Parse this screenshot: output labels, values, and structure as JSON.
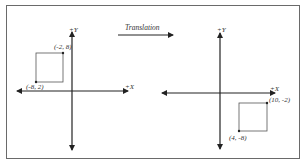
{
  "title": "Translation",
  "left_plane": {
    "x_axis_label": "+X",
    "y_axis_label": "+Y",
    "square": {
      "top_right_label": "(-2, 8)",
      "bottom_left_label": "(-8, 2)"
    }
  },
  "right_plane": {
    "x_axis_label": "+X",
    "y_axis_label": "+Y",
    "square": {
      "top_right_label": "(10, -2)",
      "bottom_left_label": "(4, -8)"
    }
  },
  "colors": {
    "axis": "#222222",
    "square": "#555555",
    "frame": "#6a6a6a"
  }
}
